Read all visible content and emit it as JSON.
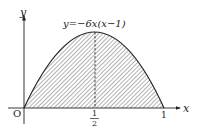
{
  "diagram": {
    "curve_label": "y=−6x(x−1)",
    "axis_x_label": "x",
    "axis_y_label": "y",
    "origin_label": "O",
    "tick_half_num": "1",
    "tick_half_den": "2",
    "tick_one": "1",
    "colors": {
      "line": "#222222",
      "hatch": "#555555",
      "background": "#ffffff"
    }
  }
}
